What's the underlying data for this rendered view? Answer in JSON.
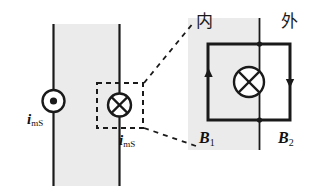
{
  "figure": {
    "type": "physics-diagram",
    "colors": {
      "line": "#1a1a1a",
      "shade": "#ebebeb",
      "background": "#ffffff",
      "dashed": "#333333"
    },
    "left_panel": {
      "shaded_region_label": "magnetized-slab",
      "current_out_symbol": "circle-dot",
      "current_in_symbol": "circle-cross",
      "labels": [
        {
          "symbol": "i",
          "subscript": "mS"
        },
        {
          "symbol": "i",
          "subscript": "mS"
        }
      ],
      "selection_box": "dashed-detail-box"
    },
    "right_panel": {
      "region_inside_label": "内",
      "region_outside_label": "外",
      "center_symbol": "circle-cross",
      "left_arrow_direction": "up",
      "right_arrow_direction": "down",
      "field_labels": [
        {
          "symbol": "B",
          "subscript": "1"
        },
        {
          "symbol": "B",
          "subscript": "2"
        }
      ]
    },
    "connectors": {
      "upper": "dashed-leader-line",
      "lower": "dashed-leader-line"
    }
  }
}
